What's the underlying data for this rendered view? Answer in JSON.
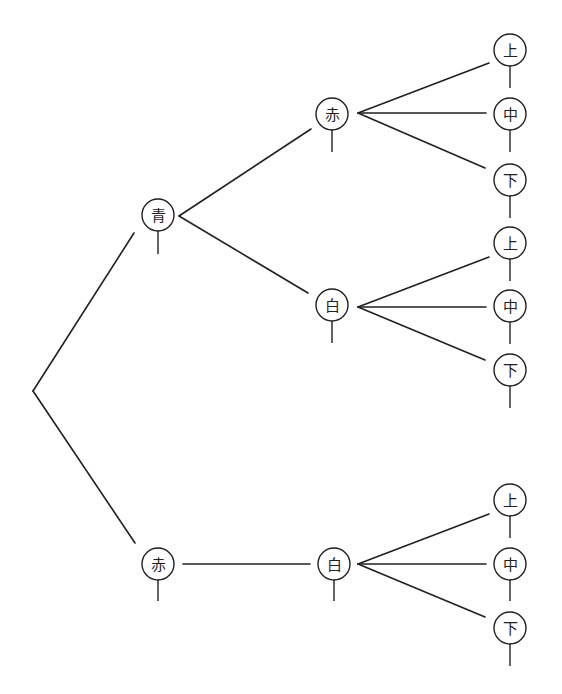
{
  "diagram": {
    "type": "tree-diagram",
    "colors": {
      "line": "#231f20",
      "background": "#ffffff"
    },
    "root": {
      "x": 33,
      "y": 391
    },
    "nodes": [
      {
        "id": "n1",
        "label": "青",
        "cx": 158,
        "cy": 215,
        "stem_to": 254
      },
      {
        "id": "n2",
        "label": "赤",
        "cx": 332,
        "cy": 114,
        "stem_to": 152
      },
      {
        "id": "n3",
        "label": "白",
        "cx": 332,
        "cy": 305,
        "stem_to": 343
      },
      {
        "id": "n4",
        "label": "上",
        "cx": 510,
        "cy": 50,
        "stem_to": 88
      },
      {
        "id": "n5",
        "label": "中",
        "cx": 510,
        "cy": 114,
        "stem_to": 152
      },
      {
        "id": "n6",
        "label": "下",
        "cx": 510,
        "cy": 180,
        "stem_to": 218
      },
      {
        "id": "n7",
        "label": "上",
        "cx": 510,
        "cy": 243,
        "stem_to": 281
      },
      {
        "id": "n8",
        "label": "中",
        "cx": 510,
        "cy": 306,
        "stem_to": 344
      },
      {
        "id": "n9",
        "label": "下",
        "cx": 510,
        "cy": 370,
        "stem_to": 408
      },
      {
        "id": "n10",
        "label": "赤",
        "cx": 158,
        "cy": 564,
        "stem_to": 601
      },
      {
        "id": "n11",
        "label": "白",
        "cx": 334,
        "cy": 564,
        "stem_to": 601
      },
      {
        "id": "n12",
        "label": "上",
        "cx": 510,
        "cy": 500,
        "stem_to": 538
      },
      {
        "id": "n13",
        "label": "中",
        "cx": 510,
        "cy": 564,
        "stem_to": 601
      },
      {
        "id": "n14",
        "label": "下",
        "cx": 510,
        "cy": 628,
        "stem_to": 666
      }
    ],
    "edges": [
      {
        "from": "root",
        "to": "n1",
        "x1": 33,
        "y1": 391,
        "x2": 134,
        "y2": 233
      },
      {
        "from": "root",
        "to": "n10",
        "x1": 33,
        "y1": 391,
        "x2": 135,
        "y2": 543
      },
      {
        "from": "n1",
        "to": "n2",
        "x1": 179,
        "y1": 216,
        "x2": 311,
        "y2": 129
      },
      {
        "from": "n1",
        "to": "n3",
        "x1": 179,
        "y1": 216,
        "x2": 308,
        "y2": 293
      },
      {
        "from": "n2",
        "to": "n4",
        "x1": 358,
        "y1": 113,
        "x2": 489,
        "y2": 63
      },
      {
        "from": "n2",
        "to": "n5",
        "x1": 358,
        "y1": 113,
        "x2": 486,
        "y2": 113
      },
      {
        "from": "n2",
        "to": "n6",
        "x1": 358,
        "y1": 113,
        "x2": 485,
        "y2": 168
      },
      {
        "from": "n3",
        "to": "n7",
        "x1": 358,
        "y1": 307,
        "x2": 489,
        "y2": 257
      },
      {
        "from": "n3",
        "to": "n8",
        "x1": 358,
        "y1": 307,
        "x2": 486,
        "y2": 307
      },
      {
        "from": "n3",
        "to": "n9",
        "x1": 358,
        "y1": 307,
        "x2": 485,
        "y2": 360
      },
      {
        "from": "n10",
        "to": "n11",
        "x1": 183,
        "y1": 564,
        "x2": 310,
        "y2": 564
      },
      {
        "from": "n11",
        "to": "n12",
        "x1": 358,
        "y1": 564,
        "x2": 489,
        "y2": 514
      },
      {
        "from": "n11",
        "to": "n13",
        "x1": 358,
        "y1": 564,
        "x2": 486,
        "y2": 564
      },
      {
        "from": "n11",
        "to": "n14",
        "x1": 358,
        "y1": 564,
        "x2": 485,
        "y2": 617
      }
    ],
    "node_radius": 16
  }
}
